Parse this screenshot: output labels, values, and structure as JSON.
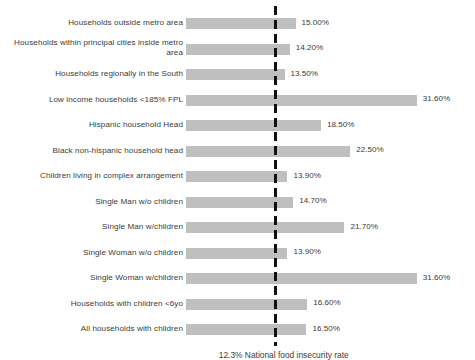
{
  "chart_data": {
    "type": "bar",
    "orientation": "horizontal",
    "title": "",
    "subtitle": "",
    "xlabel": "",
    "ylabel": "",
    "grid": false,
    "legend": "none",
    "xlim": [
      0,
      33
    ],
    "value_format": "percent",
    "categories": [
      "Households outside metro area",
      "Households within principal cities inside metro area",
      "Households regionally in the South",
      "Low income households <185% FPL",
      "Hispanic household Head",
      "Black non-hispanic household head",
      "Children living in complex arrangement",
      "Single Man w/o children",
      "Single Man w/children",
      "Single Woman w/o children",
      "Single Woman w/children",
      "Households with children <6yo",
      "All households with children"
    ],
    "values": [
      15.0,
      14.2,
      13.5,
      31.6,
      18.5,
      22.5,
      13.9,
      14.7,
      21.7,
      13.9,
      31.6,
      16.6,
      16.5
    ],
    "value_labels": [
      "15.00%",
      "14.20%",
      "13.50%",
      "31.60%",
      "18.50%",
      "22.50%",
      "13.90%",
      "14.70%",
      "21.70%",
      "13.90%",
      "31.60%",
      "16.60%",
      "16.50%"
    ],
    "annotations": [
      {
        "name": "national-food-insecurity-rate",
        "value": 12.3,
        "label": "12.3% National food insecurity rate",
        "style": "dashed-vertical-line",
        "color": "#111111"
      }
    ],
    "series_color": "#bfbfbf"
  },
  "rows": [
    {
      "label": "Households outside metro area",
      "value_label": "15.00%",
      "value": 15.0,
      "wrap": false
    },
    {
      "label": "Households within principal cities inside metro area",
      "value_label": "14.20%",
      "value": 14.2,
      "wrap": true
    },
    {
      "label": "Households regionally in the South",
      "value_label": "13.50%",
      "value": 13.5,
      "wrap": false
    },
    {
      "label": "Low income households <185% FPL",
      "value_label": "31.60%",
      "value": 31.6,
      "wrap": false
    },
    {
      "label": "Hispanic household Head",
      "value_label": "18.50%",
      "value": 18.5,
      "wrap": false
    },
    {
      "label": "Black non-hispanic household head",
      "value_label": "22.50%",
      "value": 22.5,
      "wrap": false
    },
    {
      "label": "Children living in complex arrangement",
      "value_label": "13.90%",
      "value": 13.9,
      "wrap": false
    },
    {
      "label": "Single Man w/o children",
      "value_label": "14.70%",
      "value": 14.7,
      "wrap": false
    },
    {
      "label": "Single Man w/children",
      "value_label": "21.70%",
      "value": 21.7,
      "wrap": false
    },
    {
      "label": "Single Woman w/o children",
      "value_label": "13.90%",
      "value": 13.9,
      "wrap": false
    },
    {
      "label": "Single Woman w/children",
      "value_label": "31.60%",
      "value": 31.6,
      "wrap": false
    },
    {
      "label": "Households with children <6yo",
      "value_label": "16.60%",
      "value": 16.6,
      "wrap": false
    },
    {
      "label": "All households with children",
      "value_label": "16.50%",
      "value": 16.5,
      "wrap": false
    }
  ],
  "reference": {
    "caption": "12.3% National food insecurity rate",
    "value": 12.3,
    "color": "#111111"
  }
}
